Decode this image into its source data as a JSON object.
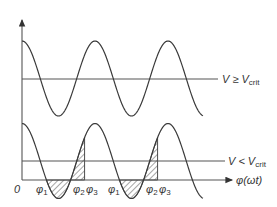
{
  "diagram": {
    "origin_label": "0",
    "x_axis_label": "φ(ωt)",
    "upper_panel": {
      "label_main": "V ≥ V",
      "label_sub": "crit"
    },
    "lower_panel": {
      "label_main": "V < V",
      "label_sub": "crit",
      "phase_labels": [
        {
          "main": "φ",
          "sub": "1"
        },
        {
          "main": "φ",
          "sub": "2"
        },
        {
          "main": "φ",
          "sub": "3"
        },
        {
          "main": "φ",
          "sub": "1"
        },
        {
          "main": "φ",
          "sub": "2"
        },
        {
          "main": "φ",
          "sub": "3"
        }
      ]
    },
    "colors": {
      "curve": "#3a3a3a",
      "line": "#555555",
      "text": "#333333",
      "background": "#ffffff"
    }
  }
}
